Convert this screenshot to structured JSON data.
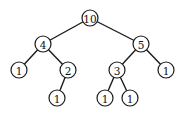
{
  "diagram": {
    "type": "binary-tree",
    "nodes": [
      {
        "id": "n0",
        "label": "10",
        "x": 90,
        "y": 18
      },
      {
        "id": "n1",
        "label": "4",
        "x": 43,
        "y": 44
      },
      {
        "id": "n2",
        "label": "5",
        "x": 141,
        "y": 44
      },
      {
        "id": "n3",
        "label": "1",
        "x": 19,
        "y": 70
      },
      {
        "id": "n4",
        "label": "2",
        "x": 68,
        "y": 70
      },
      {
        "id": "n5",
        "label": "3",
        "x": 117,
        "y": 70
      },
      {
        "id": "n6",
        "label": "1",
        "x": 166,
        "y": 70
      },
      {
        "id": "n7",
        "label": "1",
        "x": 57,
        "y": 98
      },
      {
        "id": "n8",
        "label": "1",
        "x": 105,
        "y": 98
      },
      {
        "id": "n9",
        "label": "1",
        "x": 130,
        "y": 98
      }
    ],
    "edges": [
      {
        "from": "n0",
        "to": "n1"
      },
      {
        "from": "n0",
        "to": "n2"
      },
      {
        "from": "n1",
        "to": "n3"
      },
      {
        "from": "n1",
        "to": "n4"
      },
      {
        "from": "n2",
        "to": "n5"
      },
      {
        "from": "n2",
        "to": "n6"
      },
      {
        "from": "n4",
        "to": "n7"
      },
      {
        "from": "n5",
        "to": "n8"
      },
      {
        "from": "n5",
        "to": "n9"
      }
    ],
    "node_radius": 8
  }
}
